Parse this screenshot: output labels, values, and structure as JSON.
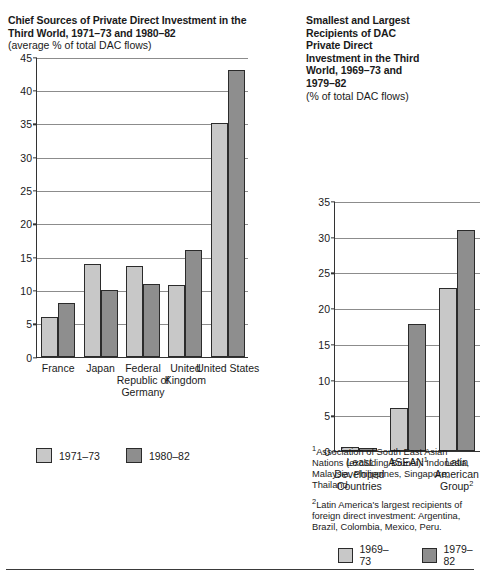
{
  "chart_data": [
    {
      "type": "bar",
      "id": "left",
      "title": "Chief Sources of Private Direct Investment in the Third World, 1971–73 and 1980–82",
      "subtitle": "(average % of total DAC flows)",
      "xlabel": "",
      "ylabel": "",
      "ylim": [
        0,
        45
      ],
      "yticks": [
        0,
        5,
        10,
        15,
        20,
        25,
        30,
        35,
        40,
        45
      ],
      "grid": true,
      "legend_position": "below",
      "categories": [
        "France",
        "Japan",
        "Federal Republic of Germany",
        "United Kingdom",
        "United States"
      ],
      "series": [
        {
          "name": "1971–73",
          "color": "#c8c8c8",
          "values": [
            6.0,
            13.9,
            13.6,
            10.7,
            35.0
          ]
        },
        {
          "name": "1980–82",
          "color": "#8e8e8e",
          "values": [
            8.0,
            10.0,
            10.9,
            16.0,
            43.0
          ]
        }
      ]
    },
    {
      "type": "bar",
      "id": "right",
      "title": "Smallest and Largest Recipients of DAC Private Direct Investment in the Third World, 1969–73 and 1979–82",
      "subtitle": "(% of total DAC flows)",
      "xlabel": "",
      "ylabel": "",
      "ylim": [
        0,
        35
      ],
      "yticks": [
        0,
        5,
        10,
        15,
        20,
        25,
        30,
        35
      ],
      "grid": true,
      "legend_position": "below",
      "categories": [
        "Least Developed Countries",
        "ASEAN¹",
        "Latin American Group²"
      ],
      "series": [
        {
          "name": "1969–73",
          "color": "#c8c8c8",
          "values": [
            0.5,
            6.0,
            22.8
          ]
        },
        {
          "name": "1979–82",
          "color": "#8e8e8e",
          "values": [
            0.4,
            17.8,
            30.9
          ]
        }
      ],
      "annotations": [
        "¹Association of South East Asian Nations (excluding Brunei): Indonesia, Malaysia, Philippines, Singapore, Thailand",
        "²Latin America's largest recipients of foreign direct investment: Argentina, Brazil, Colombia, Mexico, Peru."
      ]
    }
  ],
  "left": {
    "title": "Chief Sources of Private Direct Investment in the Third World, 1971–73 and 1980–82",
    "subtitle": "(average % of total DAC flows)",
    "categories": [
      "France",
      "Japan",
      "Federal Republic of Germany",
      "United Kingdom",
      "United States"
    ],
    "legend": [
      {
        "label": "1971–73"
      },
      {
        "label": "1980–82"
      }
    ]
  },
  "right": {
    "title": "Smallest and Largest Recipients of DAC Private Direct Investment in the Third World, 1969–73 and 1979–82",
    "subtitle": "(% of total DAC flows)",
    "categories": [
      "Least Developed Countries",
      "ASEAN¹",
      "Latin American Group²"
    ],
    "legend": [
      {
        "label": "1969–73"
      },
      {
        "label": "1979–82"
      }
    ],
    "footnotes": [
      {
        "marker": "1",
        "text": "Association of South East Asian Nations (excluding Brunei): Indonesia, Malaysia, Philippines, Singapore, Thailand"
      },
      {
        "marker": "2",
        "text": "Latin America's largest recipients of foreign direct investment: Argentina, Brazil, Colombia, Mexico, Peru."
      }
    ]
  }
}
